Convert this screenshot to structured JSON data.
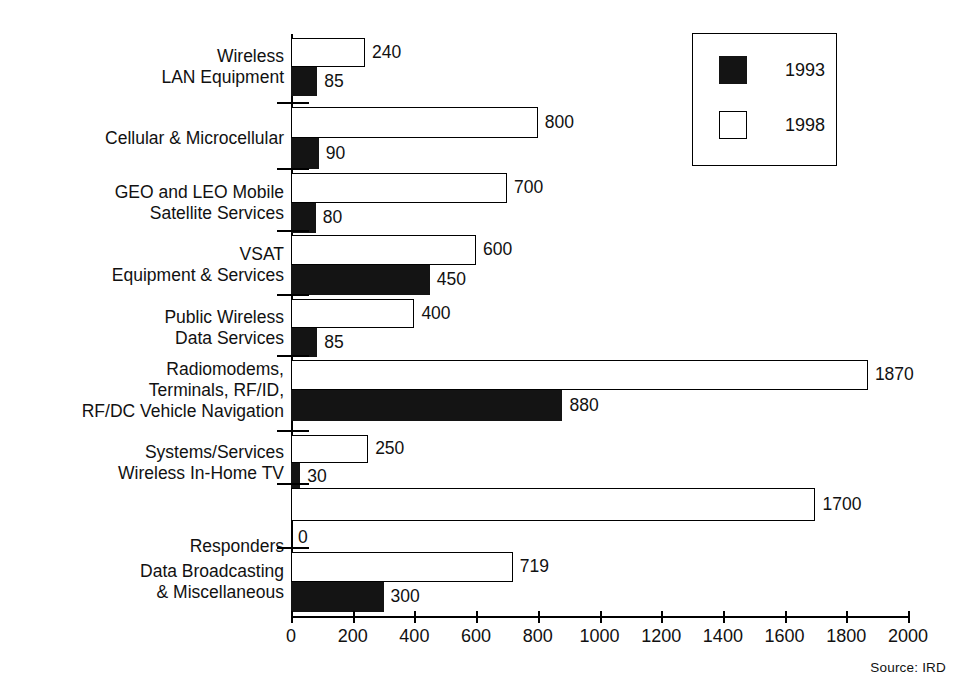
{
  "chart_data": {
    "type": "bar",
    "orientation": "horizontal",
    "title": "",
    "xlabel": "",
    "ylabel": "",
    "xlim": [
      0,
      2000
    ],
    "xticks": [
      0,
      200,
      400,
      600,
      800,
      1000,
      1200,
      1400,
      1600,
      1800,
      2000
    ],
    "grid": false,
    "legend_position": "top-right",
    "categories": [
      "Wireless\nLAN Equipment",
      "Cellular & Microcellular",
      "GEO and LEO Mobile\nSatellite Services",
      "VSAT\nEquipment & Services",
      "Public Wireless\nData Services",
      "Radiomodems,\nTerminals, RF/ID,\nRF/DC Vehicle Navigation",
      "Systems/Services\nWireless In-Home TV",
      "Responders",
      "Data Broadcasting\n& Miscellaneous"
    ],
    "series": [
      {
        "name": "1998",
        "color": "#ffffff",
        "values": [
          240,
          800,
          700,
          600,
          400,
          1870,
          250,
          1700,
          719
        ],
        "labels": [
          "240",
          "800",
          "700",
          "600",
          "400",
          "1870",
          "250",
          "1700",
          "719"
        ]
      },
      {
        "name": "1993",
        "color": "#141414",
        "values": [
          85,
          90,
          80,
          450,
          85,
          880,
          30,
          0,
          300
        ],
        "labels": [
          "85",
          "90",
          "80",
          "450",
          "85",
          "880",
          "30",
          "0",
          "300"
        ]
      }
    ]
  },
  "legend": {
    "entries": [
      {
        "label": "1993",
        "swatch": "black"
      },
      {
        "label": "1998",
        "swatch": "white"
      }
    ]
  },
  "footer": {
    "source": "Source: IRD"
  }
}
